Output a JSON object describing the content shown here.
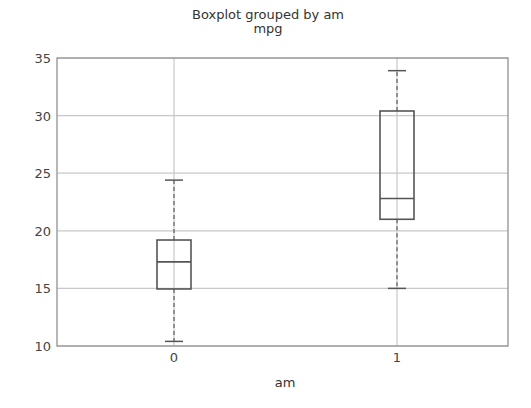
{
  "chart_data": {
    "type": "boxplot",
    "title": "Boxplot grouped by am",
    "subtitle": "mpg",
    "xlabel": "am",
    "ylabel": "",
    "ylim": [
      10,
      35
    ],
    "yticks": [
      10,
      15,
      20,
      25,
      30,
      35
    ],
    "grid": true,
    "categories": [
      "0",
      "1"
    ],
    "boxes": [
      {
        "category": "0",
        "whisker_low": 10.4,
        "q1": 14.95,
        "median": 17.3,
        "q3": 19.2,
        "whisker_high": 24.4
      },
      {
        "category": "1",
        "whisker_low": 15.0,
        "q1": 21.0,
        "median": 22.8,
        "q3": 30.4,
        "whisker_high": 33.9
      }
    ],
    "colors": {
      "box": "#555555",
      "whisker": "#666666",
      "grid": "#c8c8c8",
      "axes": "#999999"
    }
  }
}
